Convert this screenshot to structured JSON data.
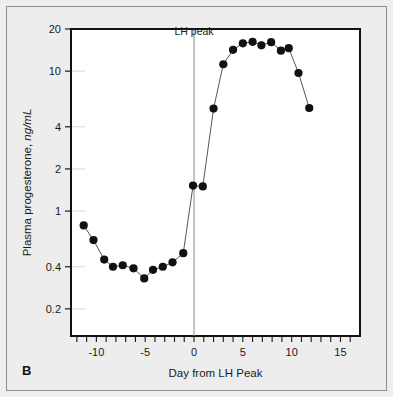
{
  "panel": {
    "letter": "B"
  },
  "chart_data": {
    "type": "line",
    "title": "",
    "xlabel": "Day from LH Peak",
    "ylabel": "Plasma progesterone, ng/mL",
    "ylabel_main": "Plasma progesterone, ",
    "ylabel_units": "ng/mL",
    "yscale": "log",
    "xscale": "linear",
    "xlim": [
      -12.6,
      17.0
    ],
    "ylim": [
      0.128,
      20.0
    ],
    "xticks": [
      -12,
      -11,
      -10,
      -9,
      -8,
      -7,
      -6,
      -5,
      -4,
      -3,
      -2,
      -1,
      0,
      1,
      2,
      3,
      4,
      5,
      6,
      7,
      8,
      9,
      10,
      11,
      12,
      13,
      14,
      15,
      16
    ],
    "xtick_labels": [
      {
        "value": -10,
        "label": "-10"
      },
      {
        "value": -5,
        "label": "-5"
      },
      {
        "value": 0,
        "label": "0"
      },
      {
        "value": 5,
        "label": "5"
      },
      {
        "value": 10,
        "label": "10"
      },
      {
        "value": 15,
        "label": "15"
      }
    ],
    "yticks": [
      20,
      10,
      4,
      2,
      1,
      0.4,
      0.2
    ],
    "ytick_labels": [
      "20",
      "10",
      "4",
      "2",
      "1",
      "0.4",
      "0.2"
    ],
    "grid": false,
    "legend": false,
    "annotations": [
      {
        "name": "lh-peak",
        "text": "LH peak",
        "x": 0,
        "type": "vline",
        "label_y": 18.2
      }
    ],
    "series": [
      {
        "name": "Plasma progesterone",
        "marker": "filled-circle",
        "color": "#111111",
        "line_color": "#555555",
        "x": [
          -11.3,
          -10.3,
          -9.2,
          -8.3,
          -7.3,
          -6.2,
          -5.1,
          -4.2,
          -3.2,
          -2.2,
          -1.1,
          -0.1,
          0.9,
          2.0,
          3.0,
          4.0,
          5.0,
          6.0,
          6.9,
          7.9,
          8.9,
          9.7,
          10.7,
          11.8
        ],
        "y": [
          0.79,
          0.62,
          0.45,
          0.4,
          0.41,
          0.39,
          0.33,
          0.38,
          0.4,
          0.43,
          0.5,
          1.52,
          1.5,
          5.4,
          11.2,
          14.2,
          15.8,
          16.2,
          15.3,
          16.1,
          14.0,
          14.6,
          9.7,
          5.45
        ]
      }
    ]
  }
}
